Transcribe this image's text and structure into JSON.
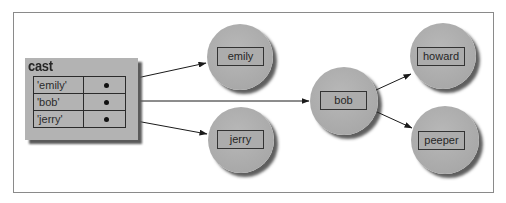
{
  "diagram": {
    "type": "object-reference-diagram",
    "colors": {
      "frame_border": "#8a8a8a",
      "box_fill": "#b3b3b3",
      "node_fill": "#aaaaaa",
      "shadow": "#4a4a4a",
      "line": "#1a1a1a"
    },
    "cast": {
      "title": "cast",
      "rows": [
        {
          "key": "'emily'",
          "target": "emily"
        },
        {
          "key": "'bob'",
          "target": "bob"
        },
        {
          "key": "'jerry'",
          "target": "jerry"
        }
      ]
    },
    "nodes": {
      "emily": {
        "label": "emily"
      },
      "jerry": {
        "label": "jerry"
      },
      "bob": {
        "label": "bob"
      },
      "howard": {
        "label": "howard"
      },
      "peeper": {
        "label": "peeper"
      }
    },
    "edges": [
      {
        "from": "cast['emily']",
        "to": "emily"
      },
      {
        "from": "cast['bob']",
        "to": "bob"
      },
      {
        "from": "cast['jerry']",
        "to": "jerry"
      },
      {
        "from": "bob",
        "to": "howard"
      },
      {
        "from": "bob",
        "to": "peeper"
      }
    ]
  }
}
